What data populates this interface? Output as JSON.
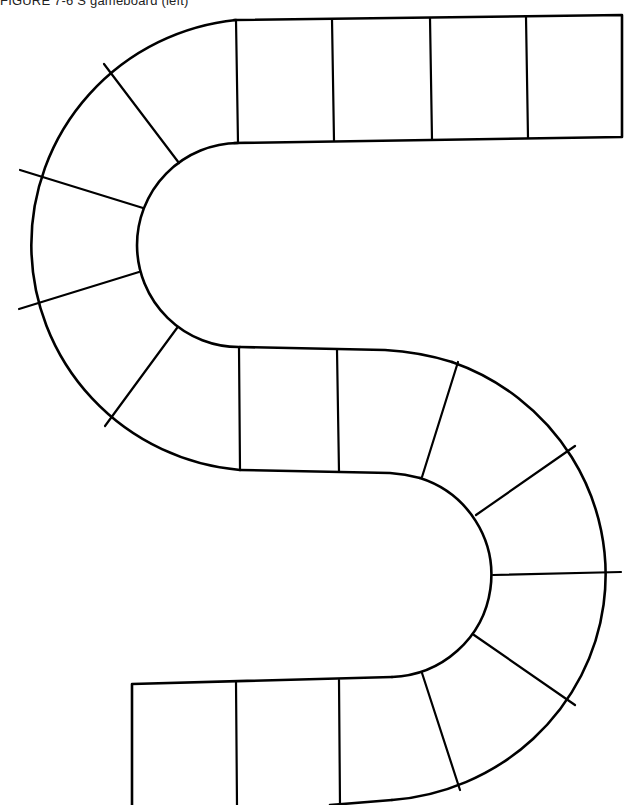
{
  "caption": "FIGURE 7-6  S gameboard (left)",
  "board": {
    "shape": "S-shaped path",
    "sections": [
      {
        "name": "top-straight",
        "spaces": 4
      },
      {
        "name": "left-arc",
        "spaces": 5
      },
      {
        "name": "middle-straight",
        "spaces": 2
      },
      {
        "name": "right-arc",
        "spaces": 6
      },
      {
        "name": "bottom-straight",
        "spaces": 3
      }
    ],
    "total_spaces": 20,
    "line_color": "#000000",
    "background_color": "#ffffff"
  }
}
